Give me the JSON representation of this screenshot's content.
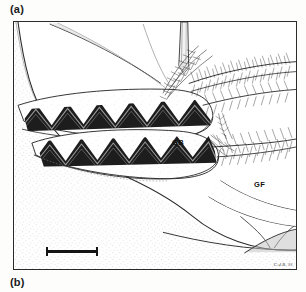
{
  "figure": {
    "panel_a_label": "(a)",
    "panel_b_label": "(b)",
    "type": "scientific-line-drawing",
    "annotations": [
      {
        "id": "GB",
        "text": "GB",
        "meaning": "gill bailer / gill book structure"
      },
      {
        "id": "GF",
        "text": "GF",
        "meaning": "gill filaments"
      }
    ],
    "annotation_gb": "GB",
    "annotation_gf": "GF",
    "signature": "C.d.B. 91",
    "scale_bar": {
      "visible": true,
      "label": ""
    },
    "frame": {
      "visible": true,
      "border_color": "#2b2b2b"
    },
    "colors": {
      "ink": "#1a1a1a",
      "paper": "#ffffff",
      "page_background": "#fdfdfc",
      "stipple": "#9a9a9a"
    },
    "elements": [
      "needle probe",
      "plumose setae (upper)",
      "plumose setae (lower)",
      "zigzag gill lamellae (upper)",
      "zigzag gill lamellae (lower)",
      "stippled carapace surface",
      "limb segments"
    ]
  }
}
